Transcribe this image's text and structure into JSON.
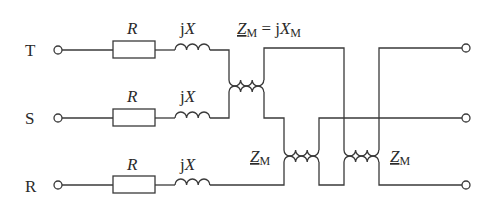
{
  "diagram": {
    "type": "circuit",
    "terminals_left": [
      {
        "label": "T"
      },
      {
        "label": "S"
      },
      {
        "label": "R"
      }
    ],
    "components": {
      "resistor_label": "R",
      "inductor_label_prefix": "j",
      "inductor_label_var": "X"
    },
    "mutual": {
      "top_label_Z": "Z",
      "top_label_sub": "M",
      "top_label_eq": " = j",
      "top_label_X": "X",
      "top_label_Xsub": "M",
      "mid_label_Z": "Z",
      "mid_label_sub": "M",
      "right_label_Z": "Z",
      "right_label_sub": "M"
    }
  }
}
